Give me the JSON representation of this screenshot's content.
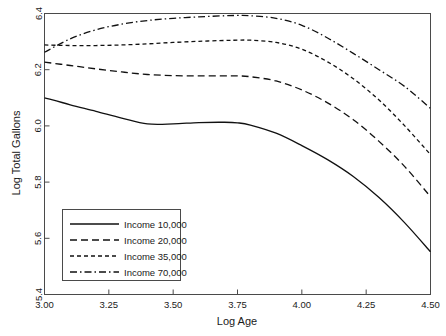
{
  "chart_data": {
    "type": "line",
    "title": "",
    "xlabel": "Log Age",
    "ylabel": "Log Total Gallons",
    "xlim": [
      3.0,
      4.5
    ],
    "ylim": [
      5.4,
      6.4
    ],
    "grid": false,
    "legend_position": "lower-left-inside",
    "xticks": [
      "3.00",
      "3.25",
      "3.50",
      "3.75",
      "4.00",
      "4.25",
      "4.50"
    ],
    "xtick_values": [
      3.0,
      3.25,
      3.5,
      3.75,
      4.0,
      4.25,
      4.5
    ],
    "yticks": [
      "6.4",
      "6.2",
      "6.0",
      "5.8",
      "5.6",
      "5.4"
    ],
    "ytick_values": [
      6.4,
      6.2,
      6.0,
      5.8,
      5.6,
      5.4
    ],
    "x": [
      3.0,
      3.1,
      3.2,
      3.3,
      3.4,
      3.5,
      3.6,
      3.7,
      3.75,
      3.8,
      3.9,
      4.0,
      4.1,
      4.2,
      4.3,
      4.4,
      4.5
    ],
    "series": [
      {
        "name": "Income 10,000",
        "dash": "solid",
        "color": "#111111",
        "values": [
          6.1,
          6.075,
          6.052,
          6.028,
          6.007,
          6.007,
          6.012,
          6.013,
          6.011,
          6.003,
          5.974,
          5.93,
          5.88,
          5.82,
          5.745,
          5.655,
          5.552
        ]
      },
      {
        "name": "Income 20,000",
        "dash": "long-dash",
        "color": "#111111",
        "values": [
          6.227,
          6.215,
          6.203,
          6.192,
          6.183,
          6.179,
          6.178,
          6.178,
          6.178,
          6.175,
          6.16,
          6.128,
          6.082,
          6.022,
          5.945,
          5.855,
          5.748
        ]
      },
      {
        "name": "Income 35,000",
        "dash": "short-dash",
        "color": "#111111",
        "values": [
          6.288,
          6.286,
          6.286,
          6.288,
          6.292,
          6.297,
          6.301,
          6.304,
          6.305,
          6.305,
          6.297,
          6.273,
          6.228,
          6.168,
          6.092,
          6.0,
          5.898
        ]
      },
      {
        "name": "Income 70,000",
        "dash": "dash-dot",
        "color": "#111111",
        "values": [
          6.262,
          6.31,
          6.342,
          6.362,
          6.375,
          6.383,
          6.388,
          6.392,
          6.393,
          6.392,
          6.383,
          6.358,
          6.313,
          6.258,
          6.2,
          6.14,
          6.062
        ]
      }
    ],
    "legend": [
      {
        "label": "Income 10,000",
        "dash": "solid"
      },
      {
        "label": "Income 20,000",
        "dash": "long-dash"
      },
      {
        "label": "Income 35,000",
        "dash": "short-dash"
      },
      {
        "label": "Income 70,000",
        "dash": "dash-dot"
      }
    ]
  }
}
